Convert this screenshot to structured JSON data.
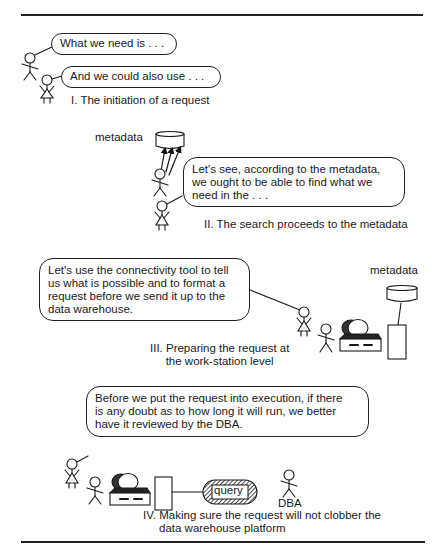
{
  "panels": [
    {
      "id": "I",
      "bubbles": [
        "What we need is . . .",
        "And we could also use . . ."
      ],
      "caption": "I. The initiation of a request"
    },
    {
      "id": "II",
      "store_label": "metadata",
      "bubble": "Let's see, according to the metadata, we ought to be able to find what we need in the . . .",
      "bubble_lines": [
        "Let's see, according to the metadata,",
        "we ought to be able to find what we",
        "need in the . . ."
      ],
      "caption": "II. The search proceeds to the metadata"
    },
    {
      "id": "III",
      "store_label": "metadata",
      "bubble_lines": [
        "Let's use the connectivity tool to tell",
        "us what is possible and to format a",
        "request before we send it up to the",
        "data warehouse."
      ],
      "caption_lines": [
        "III. Preparing the request at",
        "the work-station level"
      ]
    },
    {
      "id": "IV",
      "bubble_lines": [
        "Before we put the request into execution, if there",
        "is any doubt as to how long it will run, we better",
        "have it reviewed by the DBA."
      ],
      "query_label": "query",
      "dba_label": "DBA",
      "caption_lines": [
        "IV. Making sure the request will not clobber the",
        "data warehouse platform"
      ]
    }
  ],
  "colors": {
    "ink": "#1a1a1a",
    "background": "#ffffff",
    "hatch": "#333333"
  }
}
